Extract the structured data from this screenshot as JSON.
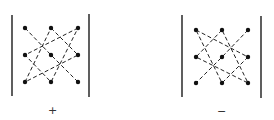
{
  "diagram": {
    "matrices": [
      {
        "sign": "+",
        "dots": [
          [
            0,
            0
          ],
          [
            0,
            1
          ],
          [
            0,
            2
          ],
          [
            1,
            0
          ],
          [
            1,
            1
          ],
          [
            1,
            2
          ],
          [
            2,
            0
          ],
          [
            2,
            1
          ],
          [
            2,
            2
          ]
        ],
        "paths": [
          [
            [
              0,
              0
            ],
            [
              1,
              1
            ],
            [
              2,
              2
            ]
          ],
          [
            [
              0,
              1
            ],
            [
              1,
              2
            ],
            [
              2,
              0
            ],
            [
              0,
              1
            ]
          ],
          [
            [
              0,
              2
            ],
            [
              1,
              0
            ],
            [
              2,
              1
            ],
            [
              0,
              2
            ]
          ]
        ]
      },
      {
        "sign": "−",
        "dots": [
          [
            0,
            0
          ],
          [
            0,
            1
          ],
          [
            0,
            2
          ],
          [
            1,
            0
          ],
          [
            1,
            1
          ],
          [
            1,
            2
          ],
          [
            2,
            0
          ],
          [
            2,
            1
          ],
          [
            2,
            2
          ]
        ],
        "paths": [
          [
            [
              0,
              2
            ],
            [
              1,
              1
            ],
            [
              2,
              0
            ]
          ],
          [
            [
              0,
              0
            ],
            [
              1,
              2
            ],
            [
              2,
              1
            ],
            [
              0,
              0
            ]
          ],
          [
            [
              0,
              1
            ],
            [
              1,
              0
            ],
            [
              2,
              2
            ],
            [
              0,
              1
            ]
          ]
        ]
      }
    ],
    "colors": {
      "ink": "#1a1a1a",
      "background": "#ffffff"
    }
  }
}
